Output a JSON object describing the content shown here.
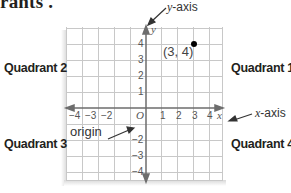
{
  "header": {
    "text": "rants ."
  },
  "quadrants": {
    "q1": "Quadrant 1",
    "q2": "Quadrant 2",
    "q3": "Quadrant 3",
    "q4": "Quadrant 4"
  },
  "callouts": {
    "y_axis_prefix": "y",
    "y_axis_suffix": "-axis",
    "x_axis_prefix": "x",
    "x_axis_suffix": "-axis",
    "origin": "origin"
  },
  "axes": {
    "x_letter": "x",
    "y_letter": "y",
    "origin_letter": "O",
    "x_ticks": [
      {
        "value": -4,
        "label": "−4"
      },
      {
        "value": -3,
        "label": "−3"
      },
      {
        "value": -2,
        "label": "−2"
      },
      {
        "value": 1,
        "label": "1"
      },
      {
        "value": 2,
        "label": "2"
      },
      {
        "value": 3,
        "label": "3"
      },
      {
        "value": 4,
        "label": "4"
      }
    ],
    "y_ticks": [
      {
        "value": 4,
        "label": "4"
      },
      {
        "value": 3,
        "label": "3"
      },
      {
        "value": 2,
        "label": "2"
      },
      {
        "value": 1,
        "label": "1"
      },
      {
        "value": -2,
        "label": "−2"
      },
      {
        "value": -3,
        "label": "−3"
      },
      {
        "value": -4,
        "label": "−4"
      }
    ]
  },
  "point": {
    "x": 3,
    "y": 4,
    "label": "(3, 4)"
  },
  "colors": {
    "grid": "#c8c8c8",
    "axis": "#6d6d6d",
    "point": "#000000",
    "text": "#231f20"
  }
}
